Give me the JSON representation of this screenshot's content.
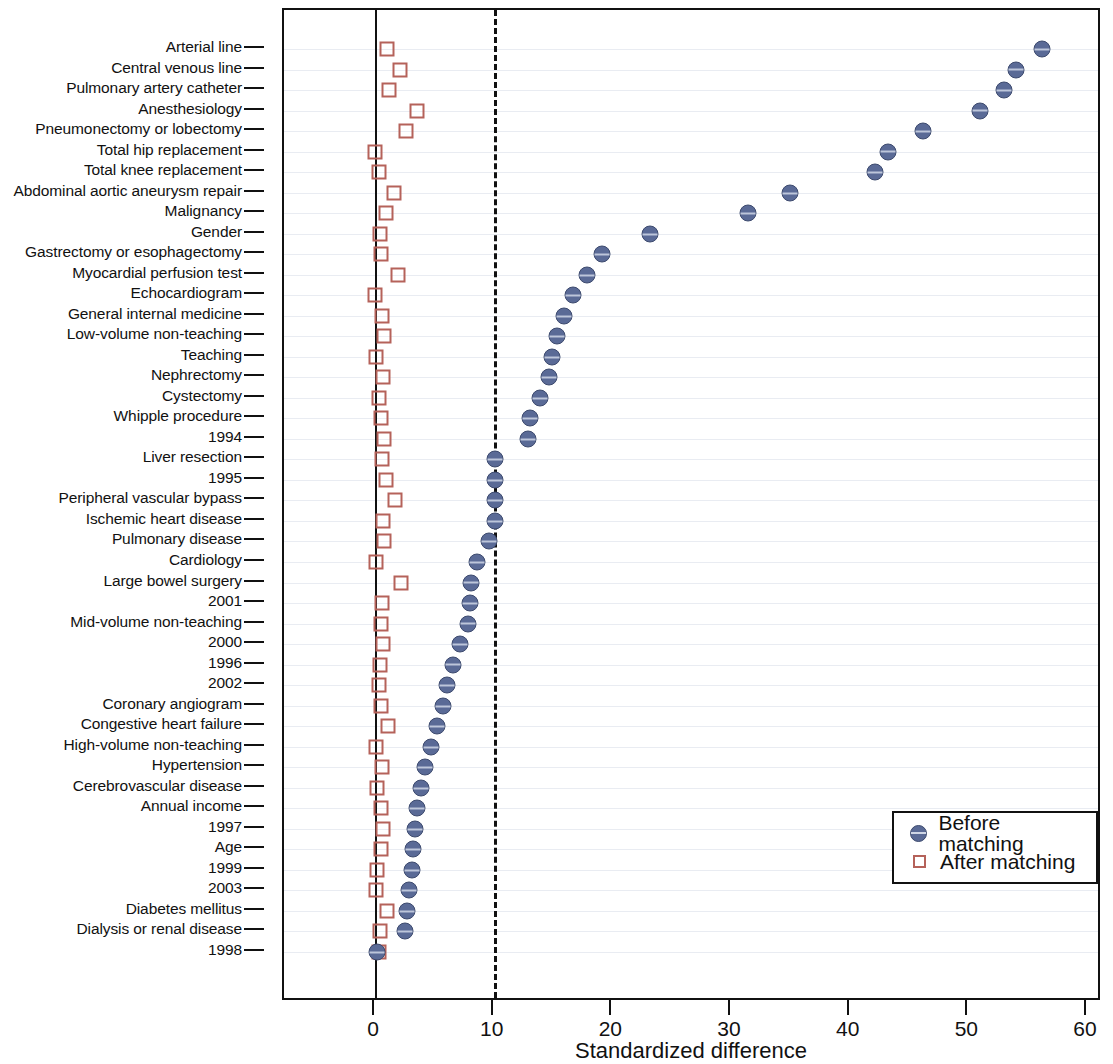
{
  "chart_data": {
    "type": "scatter",
    "title": "",
    "xlabel": "Standardized difference",
    "ylabel": "",
    "xlim": [
      -5,
      60
    ],
    "xticks": [
      0,
      10,
      20,
      30,
      40,
      50,
      60
    ],
    "xticklabels": [
      "0",
      "10",
      "20",
      "30",
      "40",
      "50",
      "60"
    ],
    "grid": true,
    "grid_axis": "y",
    "reference_lines": [
      {
        "x": 0,
        "style": "solid",
        "color": "#111111"
      },
      {
        "x": 10,
        "style": "dashed",
        "color": "#111111"
      }
    ],
    "legend": {
      "position": "center-right",
      "entries": [
        {
          "label": "Before matching",
          "marker": "filled-circle",
          "color": "#5a6a96"
        },
        {
          "label": "After matching",
          "marker": "open-square",
          "color": "#b5625a"
        }
      ]
    },
    "categories": [
      "Arterial line",
      "Central venous line",
      "Pulmonary artery catheter",
      "Anesthesiology",
      "Pneumonectomy or lobectomy",
      "Total hip replacement",
      "Total knee replacement",
      "Abdominal aortic aneurysm repair",
      "Malignancy",
      "Gender",
      "Gastrectomy or esophagectomy",
      "Myocardial perfusion test",
      "Echocardiogram",
      "General internal medicine",
      "Low-volume non-teaching",
      "Teaching",
      "Nephrectomy",
      "Cystectomy",
      "Whipple procedure",
      "1994",
      "Liver resection",
      "1995",
      "Peripheral vascular bypass",
      "Ischemic heart disease",
      "Pulmonary disease",
      "Cardiology",
      "Large bowel surgery",
      "2001",
      "Mid-volume non-teaching",
      "2000",
      "1996",
      "2002",
      "Coronary angiogram",
      "Congestive heart failure",
      "High-volume non-teaching",
      "Hypertension",
      "Cerebrovascular disease",
      "Annual income",
      "1997",
      "Age",
      "1999",
      "2003",
      "Diabetes mellitus",
      "Dialysis or renal disease",
      "1998"
    ],
    "series": [
      {
        "name": "Before matching",
        "marker": "filled-circle",
        "color": "#5a6a96",
        "values": [
          56.2,
          54.0,
          53.0,
          51.0,
          46.2,
          43.2,
          42.1,
          35.0,
          31.4,
          23.2,
          19.1,
          17.9,
          16.7,
          15.9,
          15.3,
          14.9,
          14.7,
          13.9,
          13.1,
          12.9,
          10.1,
          10.1,
          10.1,
          10.1,
          9.6,
          8.6,
          8.1,
          8.0,
          7.8,
          7.2,
          6.6,
          6.1,
          5.7,
          5.2,
          4.7,
          4.2,
          3.9,
          3.5,
          3.4,
          3.2,
          3.1,
          2.9,
          2.7,
          2.5,
          0.2
        ]
      },
      {
        "name": "After matching",
        "marker": "open-square",
        "color": "#b5625a",
        "values": [
          1.0,
          2.1,
          1.2,
          3.5,
          2.6,
          0.0,
          0.3,
          1.6,
          0.9,
          0.4,
          0.5,
          1.9,
          0.0,
          0.6,
          0.8,
          0.1,
          0.7,
          0.3,
          0.5,
          0.8,
          0.6,
          0.9,
          1.7,
          0.7,
          0.8,
          0.1,
          2.2,
          0.6,
          0.5,
          0.7,
          0.4,
          0.3,
          0.5,
          1.1,
          0.1,
          0.6,
          0.2,
          0.5,
          0.7,
          0.5,
          0.2,
          0.1,
          1.0,
          0.4,
          0.3
        ]
      }
    ]
  }
}
